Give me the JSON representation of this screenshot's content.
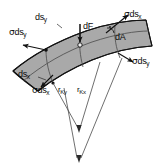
{
  "figure": {
    "surface_fill": "#a9a9a9",
    "surface_stroke": "#1a1a1a",
    "line_color": "#3a3a3a",
    "text_color": "#0b0b0b",
    "background": "#ffffff"
  },
  "labels": {
    "ds_y_top": {
      "main": "ds",
      "sub": "y"
    },
    "sigma_ds_y_left": {
      "sigma": "σ",
      "main": "ds",
      "sub": "y"
    },
    "dF_center": {
      "main": "dF",
      "sub": ""
    },
    "sigma_ds_x_topright": {
      "sigma": "σ",
      "main": "ds",
      "sub": "x"
    },
    "dA_area": {
      "main": "dA",
      "sub": ""
    },
    "sigma_ds_y_right": {
      "sigma": "σ",
      "main": "ds",
      "sub": "y"
    },
    "ds_x_bottomleft": {
      "main": "ds",
      "sub": "x"
    },
    "sigma_ds_x_bottom": {
      "sigma": "σ",
      "main": "ds",
      "sub": "x"
    },
    "r_ky": {
      "main": "r",
      "sub": "Ky"
    },
    "r_kx": {
      "main": "r",
      "sub": "Kx"
    }
  }
}
